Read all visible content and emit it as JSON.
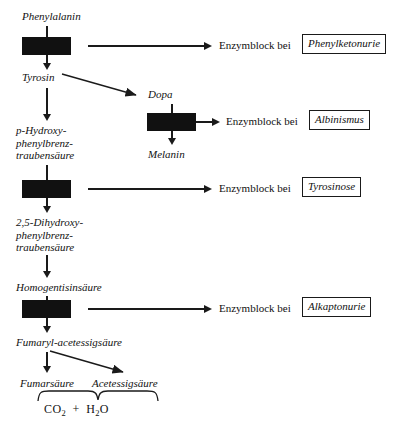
{
  "diagram": {
    "type": "metabolic-pathway-flowchart",
    "enzyme_block_label": "Enzymblock bei",
    "metabolites": [
      {
        "id": "phenylalanin",
        "label": "Phenylalanin"
      },
      {
        "id": "tyrosin",
        "label": "Tyrosin"
      },
      {
        "id": "dopa",
        "label": "Dopa"
      },
      {
        "id": "melanin",
        "label": "Melanin"
      },
      {
        "id": "p-hydroxyphenylbrenztraubensaeure",
        "label": "p-Hydroxy-\nphenylbrenz-\ntraubensäure"
      },
      {
        "id": "dihydroxyphenylbrenztraubensaeure",
        "label": "2,5-Dihydroxy-\nphenylbrenz-\ntraubensäure"
      },
      {
        "id": "homogentisinsaeure",
        "label": "Homogentisinsäure"
      },
      {
        "id": "fumarylacetessigsaeure",
        "label": "Fumaryl-acetessigsäure"
      },
      {
        "id": "fumarsaeure",
        "label": "Fumarsäure"
      },
      {
        "id": "acetessigsaeure",
        "label": "Acetessigsäure"
      }
    ],
    "blocks": [
      {
        "id": "block-pku",
        "disease": "Phenylketonurie"
      },
      {
        "id": "block-albinismus",
        "disease": "Albinismus"
      },
      {
        "id": "block-tyrosinose",
        "disease": "Tyrosinose"
      },
      {
        "id": "block-alkaptonurie",
        "disease": "Alkaptonurie"
      }
    ],
    "end_products": "CO2 + H2O",
    "end_products_parts": {
      "first": "CO",
      "first_sub": "2",
      "operator": "+",
      "second": "H",
      "second_sub": "2",
      "second_tail": "O"
    },
    "colors": {
      "ink": "#111111",
      "block_fill": "#111111",
      "background": "#ffffff"
    }
  }
}
